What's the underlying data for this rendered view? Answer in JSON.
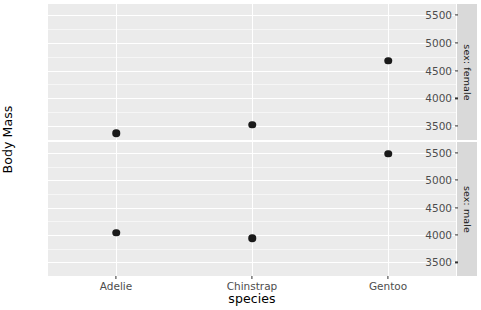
{
  "chart_data": {
    "type": "scatter",
    "title": "",
    "subtitle": "",
    "xlabel": "species",
    "ylabel": "Body Mass",
    "categories": [
      "Adelie",
      "Chinstrap",
      "Gentoo"
    ],
    "ylim": [
      3250,
      5700
    ],
    "y_ticks": [
      3500,
      4000,
      4500,
      5000,
      5500
    ],
    "y_tick_labels": [
      "3500",
      "4000",
      "4500",
      "5000",
      "5500"
    ],
    "y_minor_ticks": [
      3750,
      4250,
      4750,
      5250
    ],
    "grid": true,
    "legend": "none",
    "facet_variable": "sex",
    "facet_position": "right",
    "facets": [
      {
        "id": "female",
        "strip_label": "sex: female",
        "series": [
          {
            "name": "Adelie",
            "x": "Adelie",
            "y": 3370
          },
          {
            "name": "Chinstrap",
            "x": "Chinstrap",
            "y": 3527
          },
          {
            "name": "Gentoo",
            "x": "Gentoo",
            "y": 4680
          }
        ]
      },
      {
        "id": "male",
        "strip_label": "sex: male",
        "series": [
          {
            "name": "Adelie",
            "x": "Adelie",
            "y": 4043
          },
          {
            "name": "Chinstrap",
            "x": "Chinstrap",
            "y": 3939
          },
          {
            "name": "Gentoo",
            "x": "Gentoo",
            "y": 5485
          }
        ]
      }
    ],
    "colors": {
      "panel_background": "#ebebeb",
      "gridline_major": "#ffffff",
      "gridline_minor": "#f6f6f6",
      "point": "#1a1a1a",
      "strip_background": "#d9d9d9",
      "axis_text": "#4d4d4d",
      "axis_title": "#000000",
      "plot_background": "#ffffff"
    }
  },
  "axis": {
    "y_title": "Body Mass",
    "x_title": "species"
  }
}
